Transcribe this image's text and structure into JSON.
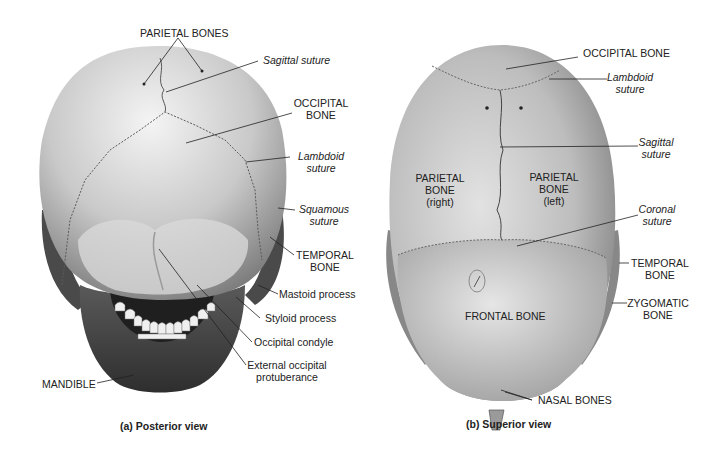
{
  "figure": {
    "posterior": {
      "caption": "(a) Posterior view",
      "labels": {
        "parietal_bones": "PARIETAL BONES",
        "sagittal_suture": "Sagittal suture",
        "occipital_bone_1": "OCCIPITAL",
        "occipital_bone_2": "BONE",
        "lambdoid_suture_1": "Lambdoid",
        "lambdoid_suture_2": "suture",
        "squamous_suture_1": "Squamous",
        "squamous_suture_2": "suture",
        "temporal_bone_1": "TEMPORAL",
        "temporal_bone_2": "BONE",
        "mastoid_process": "Mastoid process",
        "styloid_process": "Styloid process",
        "occipital_condyle": "Occipital condyle",
        "ext_occ_prot_1": "External occipital",
        "ext_occ_prot_2": "protuberance",
        "mandible": "MANDIBLE"
      }
    },
    "superior": {
      "caption": "(b) Superior view",
      "labels": {
        "occipital_bone": "OCCIPITAL BONE",
        "lambdoid_suture_1": "Lambdoid",
        "lambdoid_suture_2": "suture",
        "sagittal_suture_1": "Sagittal",
        "sagittal_suture_2": "suture",
        "parietal_right_1": "PARIETAL",
        "parietal_right_2": "BONE",
        "parietal_right_3": "(right)",
        "parietal_left_1": "PARIETAL",
        "parietal_left_2": "BONE",
        "parietal_left_3": "(left)",
        "coronal_suture_1": "Coronal",
        "coronal_suture_2": "suture",
        "temporal_bone_1": "TEMPORAL",
        "temporal_bone_2": "BONE",
        "zygomatic_bone_1": "ZYGOMATIC",
        "zygomatic_bone_2": "BONE",
        "frontal_bone": "FRONTAL BONE",
        "nasal_bones": "NASAL BONES"
      }
    }
  }
}
